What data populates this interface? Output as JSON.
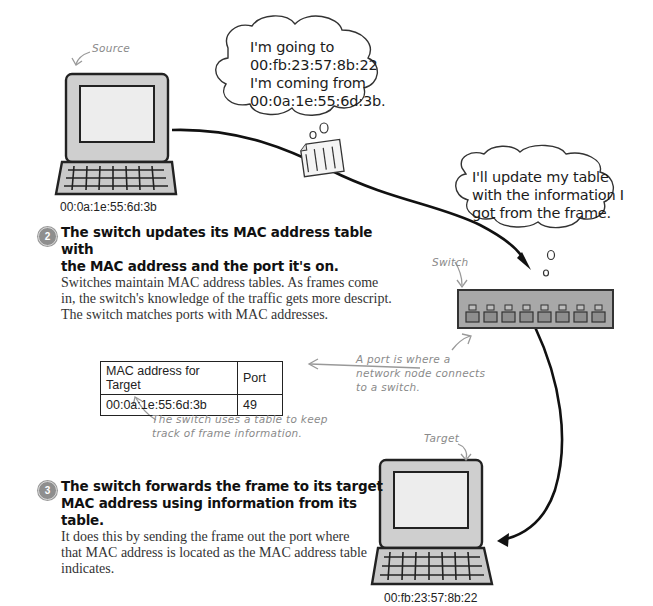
{
  "source": {
    "label": "Source",
    "mac": "00:0a:1e:55:6d:3b"
  },
  "target": {
    "label": "Target",
    "mac": "00:fb:23:57:8b:22"
  },
  "switch": {
    "label": "Switch",
    "port_count": 8
  },
  "frame_bubble": {
    "lines": [
      "I'm going to",
      "00:fb:23:57:8b:22",
      "I'm coming from",
      "00:0a:1e:55:6d:3b."
    ]
  },
  "switch_bubble": {
    "lines": [
      "I'll update my table",
      "with the information I",
      "got from the frame."
    ]
  },
  "frame_icon": {
    "bits": [
      "1001",
      "1101",
      "0010",
      "1011"
    ]
  },
  "steps": [
    {
      "number": "2",
      "heading_lines": [
        "The switch updates its MAC address table with",
        "the MAC address and the port it's on."
      ],
      "body_lines": [
        "Switches maintain MAC address tables. As frames come",
        "in, the switch's knowledge of the traffic gets more descript.",
        "The switch matches ports with MAC addresses."
      ]
    },
    {
      "number": "3",
      "heading_lines": [
        "The switch forwards the frame to its target",
        "MAC address using information from its table."
      ],
      "body_lines": [
        "It does this by sending the frame out the port where",
        "that MAC address is located as the MAC address table",
        "indicates."
      ]
    }
  ],
  "mac_table": {
    "headers": [
      "MAC address for Target",
      "Port"
    ],
    "rows": [
      [
        "00:0a:1e:55:6d:3b",
        "49"
      ]
    ]
  },
  "annotations": {
    "port_note": [
      "A port is where a",
      "network node connects",
      "to a switch."
    ],
    "table_note": [
      "The switch uses a table to keep",
      "track of frame information."
    ]
  }
}
